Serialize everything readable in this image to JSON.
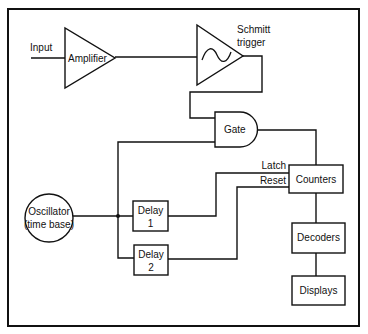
{
  "diagram": {
    "title": "",
    "input_label": "Input",
    "blocks": {
      "amplifier": "Amplifier",
      "schmitt_line1": "Schmitt",
      "schmitt_line2": "trigger",
      "gate": "Gate",
      "counters": "Counters",
      "decoders": "Decoders",
      "displays": "Displays",
      "oscillator_line1": "Oscillator",
      "oscillator_line2": "(time base)",
      "delay1_line1": "Delay",
      "delay1_line2": "1",
      "delay2_line1": "Delay",
      "delay2_line2": "2"
    },
    "signals": {
      "latch": "Latch",
      "reset": "Reset"
    },
    "icons": {
      "schmitt_symbol": "hysteresis-sine-icon"
    },
    "connections": [
      {
        "from": "Input",
        "to": "Amplifier"
      },
      {
        "from": "Amplifier",
        "to": "Schmitt trigger"
      },
      {
        "from": "Schmitt trigger",
        "to": "Gate"
      },
      {
        "from": "Oscillator (time base)",
        "to": "Gate"
      },
      {
        "from": "Oscillator (time base)",
        "to": "Delay 1"
      },
      {
        "from": "Oscillator (time base)",
        "to": "Delay 2"
      },
      {
        "from": "Gate",
        "to": "Counters"
      },
      {
        "from": "Delay 1",
        "to": "Counters",
        "label": "Latch"
      },
      {
        "from": "Delay 2",
        "to": "Counters",
        "label": "Reset"
      },
      {
        "from": "Counters",
        "to": "Decoders"
      },
      {
        "from": "Decoders",
        "to": "Displays"
      }
    ]
  }
}
